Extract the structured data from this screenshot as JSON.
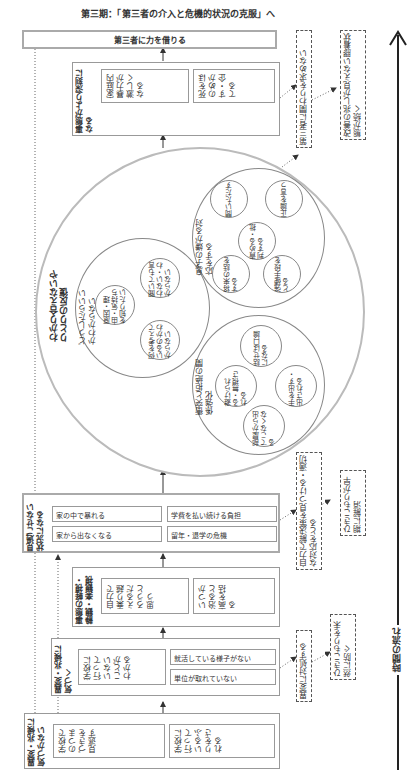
{
  "phase_title": "第三期：「第三者の介入と危機的状況の克服」へ",
  "time_axis_label": "時間の流れ",
  "stages": [
    {
      "label": "異変・兆候に気づかない",
      "items": [
        "学校でのつまづきを見逃す",
        "学校に行っているふりをされる"
      ]
    },
    {
      "label": "異変・兆候に気づく",
      "items": [
        "学校に行っていないことがわかる",
        "就活している様子がない",
        "単位が取れていない"
      ]
    },
    {
      "label": "事態の軽視・静観・楽観視",
      "items": [
        "自力で乗り越えるだろうと思う",
        "いつか治ると高を括る"
      ]
    },
    {
      "label": "見過ごせない状況になる",
      "items": [
        "家の中で暴れる",
        "学費を払い続ける負担",
        "家から出なくなる",
        "留年・退学の危機"
      ]
    },
    {
      "label": "事態がより深刻になる",
      "items": [
        "家庭内暴力が激しくなる",
        "死をほのめかす・企てる"
      ]
    },
    {
      "label": "第三者に力を借りる",
      "items": []
    }
  ],
  "cycle": {
    "title": "わかり合えないやりとりの反復",
    "left": {
      "label": "どうしたらいいかわからない",
      "items": [
        "原因・理由・気持ちを知りたい",
        "聞いても言わない・わからない",
        "何を考えているのかわからない"
      ]
    },
    "top": {
      "label": "息子の嫌がる対応をする",
      "items": [
        "問いただす",
        "正論を言う",
        "責める・批判する",
        "将来の話をする",
        "強硬手段をとる"
      ]
    },
    "bottom": {
      "label": "衝突と拒絶の関係強化",
      "items": [
        "話せば口論になる",
        "避けられる・無視される",
        "手を出す・出される",
        "部屋から出てこなくなる"
      ]
    }
  },
  "side_notes": [
    {
      "text": "異変に対処する",
      "result": "ひきこもりを未然に防ぐ"
    },
    {
      "text": "自力で解決策を見つける・適切な対応をとる",
      "result": "ひきこもりが早期に解消"
    },
    {
      "text": "第三者に関わりを求めない",
      "result": "改善の兆しが見えない膠着状態が続く"
    }
  ]
}
